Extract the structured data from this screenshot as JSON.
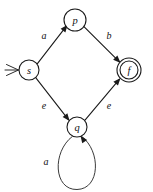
{
  "diagram": {
    "kind": "finite-state-automaton",
    "canvas": {
      "width": 153,
      "height": 192,
      "background": "#ffffff"
    },
    "stroke_color": "#1a1a1a",
    "text_color": "#111111",
    "states": [
      {
        "id": "s",
        "label": "s",
        "cx": 29,
        "cy": 70,
        "r": 10,
        "accepting": false,
        "start": true
      },
      {
        "id": "p",
        "label": "p",
        "cx": 75,
        "cy": 20,
        "r": 11,
        "accepting": false,
        "start": false
      },
      {
        "id": "q",
        "label": "q",
        "cx": 77,
        "cy": 127,
        "r": 10,
        "accepting": false,
        "start": false
      },
      {
        "id": "f",
        "label": "f",
        "cx": 129,
        "cy": 70,
        "r": 12,
        "r_inner": 9,
        "accepting": true,
        "start": false
      }
    ],
    "transitions": [
      {
        "id": "s-to-p",
        "from": "s",
        "to": "p",
        "label": "a",
        "label_x": 44,
        "label_y": 35,
        "path": "M 37.4 63.6 L 66.4 26.2",
        "arrow_x": 67.6,
        "arrow_y": 24.7,
        "arrow_angle": -52.2
      },
      {
        "id": "p-to-f",
        "from": "p",
        "to": "f",
        "label": "b",
        "label_x": 109,
        "label_y": 35,
        "path": "M 84.2 26.9 L 119.4 61.8",
        "arrow_x": 120.6,
        "arrow_y": 63.0,
        "arrow_angle": 44.8
      },
      {
        "id": "s-to-q",
        "from": "s",
        "to": "q",
        "label": "e",
        "label_x": 44,
        "label_y": 105,
        "path": "M 35.5 77.3 L 68.4 119.6",
        "arrow_x": 69.6,
        "arrow_y": 121.1,
        "arrow_angle": 52.1
      },
      {
        "id": "q-to-f",
        "from": "q",
        "to": "f",
        "label": "e",
        "label_x": 109,
        "label_y": 105,
        "path": "M 85.0 120.1 L 119.3 79.3",
        "arrow_x": 120.5,
        "arrow_y": 77.9,
        "arrow_angle": -50.0
      },
      {
        "id": "q-self-loop",
        "from": "q",
        "to": "q",
        "label": "a",
        "label_x": 46,
        "label_y": 161,
        "self_loop": true,
        "path": "M 72.5 136.3 C 52.0 152.0 53.5 190.0 77.0 189.5 C 100.5 189.0 101.0 151.0 81.6 136.4",
        "arrow_x": 80.4,
        "arrow_y": 135.5,
        "arrow_angle": -125.0
      }
    ],
    "start_marker": {
      "id": "start-arrow",
      "target": "s",
      "path": "M 6.5 64.5 L 18.5 70.0 L 6.5 75.5",
      "tail_path": "M 5.0 70.0 L 18.5 70.0"
    }
  }
}
